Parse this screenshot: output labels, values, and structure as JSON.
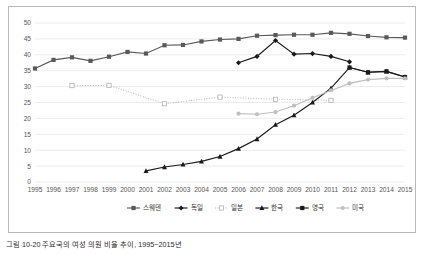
{
  "chart_data": {
    "type": "line",
    "title": "",
    "xlabel": "",
    "ylabel": "",
    "x": [
      1995,
      1996,
      1997,
      1998,
      1999,
      2000,
      2001,
      2002,
      2003,
      2004,
      2005,
      2006,
      2007,
      2008,
      2009,
      2010,
      2011,
      2012,
      2013,
      2014,
      2015
    ],
    "xlim": [
      1995,
      2015
    ],
    "ylim": [
      0,
      50
    ],
    "ytick_labels": [
      "0",
      "5",
      "10",
      "15",
      "20",
      "25",
      "30",
      "35",
      "40",
      "45",
      "50"
    ],
    "xtick_labels": [
      "1995",
      "1996",
      "1997",
      "1998",
      "1999",
      "2000",
      "2001",
      "2002",
      "2003",
      "2004",
      "2005",
      "2006",
      "2007",
      "2008",
      "2009",
      "2010",
      "2011",
      "2012",
      "2013",
      "2014",
      "2015"
    ],
    "grid": true,
    "grid_axis": "y",
    "legend_position": "bottom",
    "series": [
      {
        "name": "스웨덴",
        "color": "#595959",
        "marker": "square",
        "style": "solid",
        "points": [
          {
            "x": 1995,
            "y": 35.7
          },
          {
            "x": 1996,
            "y": 38.4
          },
          {
            "x": 1997,
            "y": 39.2
          },
          {
            "x": 1998,
            "y": 38.1
          },
          {
            "x": 1999,
            "y": 39.4
          },
          {
            "x": 2000,
            "y": 40.9
          },
          {
            "x": 2001,
            "y": 40.4
          },
          {
            "x": 2002,
            "y": 43.0
          },
          {
            "x": 2003,
            "y": 43.1
          },
          {
            "x": 2004,
            "y": 44.2
          },
          {
            "x": 2005,
            "y": 44.8
          },
          {
            "x": 2006,
            "y": 45.0
          },
          {
            "x": 2007,
            "y": 46.0
          },
          {
            "x": 2008,
            "y": 46.2
          },
          {
            "x": 2009,
            "y": 46.3
          },
          {
            "x": 2010,
            "y": 46.3
          },
          {
            "x": 2011,
            "y": 46.9
          },
          {
            "x": 2012,
            "y": 46.6
          },
          {
            "x": 2013,
            "y": 45.9
          },
          {
            "x": 2014,
            "y": 45.5
          },
          {
            "x": 2015,
            "y": 45.4
          }
        ]
      },
      {
        "name": "독일",
        "color": "#1a1a1a",
        "marker": "diamond",
        "style": "solid",
        "points": [
          {
            "x": 2006,
            "y": 37.5
          },
          {
            "x": 2007,
            "y": 39.5
          },
          {
            "x": 2008,
            "y": 44.5
          },
          {
            "x": 2009,
            "y": 40.2
          },
          {
            "x": 2010,
            "y": 40.4
          },
          {
            "x": 2011,
            "y": 39.5
          },
          {
            "x": 2012,
            "y": 37.8
          }
        ]
      },
      {
        "name": "일본",
        "color": "#a6a6a6",
        "marker": "open-square",
        "style": "dotted",
        "points": [
          {
            "x": 1997,
            "y": 30.3
          },
          {
            "x": 1999,
            "y": 30.4
          },
          {
            "x": 2002,
            "y": 24.6
          },
          {
            "x": 2005,
            "y": 26.7
          },
          {
            "x": 2008,
            "y": 26.0
          },
          {
            "x": 2011,
            "y": 25.7
          }
        ]
      },
      {
        "name": "한국",
        "color": "#1a1a1a",
        "marker": "triangle",
        "style": "solid",
        "points": [
          {
            "x": 2001,
            "y": 3.5
          },
          {
            "x": 2002,
            "y": 4.7
          },
          {
            "x": 2003,
            "y": 5.5
          },
          {
            "x": 2004,
            "y": 6.5
          },
          {
            "x": 2005,
            "y": 8.0
          },
          {
            "x": 2006,
            "y": 10.5
          },
          {
            "x": 2007,
            "y": 13.5
          },
          {
            "x": 2008,
            "y": 18.0
          },
          {
            "x": 2009,
            "y": 21.0
          },
          {
            "x": 2010,
            "y": 25.0
          },
          {
            "x": 2011,
            "y": 29.5
          },
          {
            "x": 2012,
            "y": 36.0
          },
          {
            "x": 2013,
            "y": 34.5
          },
          {
            "x": 2014,
            "y": 34.8
          },
          {
            "x": 2015,
            "y": 33.0
          }
        ]
      },
      {
        "name": "영국",
        "color": "#1a1a1a",
        "marker": "square",
        "style": "solid",
        "points": [
          {
            "x": 2012,
            "y": 36.0
          },
          {
            "x": 2013,
            "y": 34.5
          },
          {
            "x": 2014,
            "y": 34.8
          },
          {
            "x": 2015,
            "y": 33.0
          }
        ]
      },
      {
        "name": "미국",
        "color": "#bfbfbf",
        "marker": "circle",
        "style": "solid",
        "points": [
          {
            "x": 2006,
            "y": 21.5
          },
          {
            "x": 2007,
            "y": 21.3
          },
          {
            "x": 2008,
            "y": 22.0
          },
          {
            "x": 2009,
            "y": 24.0
          },
          {
            "x": 2010,
            "y": 26.5
          },
          {
            "x": 2011,
            "y": 28.8
          },
          {
            "x": 2012,
            "y": 31.0
          },
          {
            "x": 2013,
            "y": 32.2
          },
          {
            "x": 2014,
            "y": 32.6
          },
          {
            "x": 2015,
            "y": 32.6
          }
        ]
      }
    ]
  },
  "legend": {
    "items": [
      {
        "label": "스웨덴"
      },
      {
        "label": "독일"
      },
      {
        "label": "일본"
      },
      {
        "label": "한국"
      },
      {
        "label": "영국"
      },
      {
        "label": "미국"
      }
    ]
  },
  "caption": {
    "text": "그림 10-20 주요국의 여성 의원 비율 추이, 1995~2015년"
  }
}
